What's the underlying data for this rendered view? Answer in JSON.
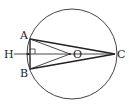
{
  "diagram": {
    "type": "geometry",
    "circle": {
      "cx": 72,
      "cy": 54,
      "r": 45
    },
    "points": {
      "A": {
        "label": "A",
        "x": 30,
        "y": 39
      },
      "B": {
        "label": "B",
        "x": 30,
        "y": 69
      },
      "C": {
        "label": "C",
        "x": 116,
        "y": 54
      },
      "O": {
        "label": "O",
        "x": 70,
        "y": 54
      },
      "H": {
        "label": "H",
        "x": 28,
        "y": 54
      }
    },
    "segments": [
      "AB",
      "AC",
      "BC",
      "AO",
      "BO",
      "HO",
      "HC"
    ],
    "right_angle_at": "H",
    "stroke_color": "#333333"
  }
}
